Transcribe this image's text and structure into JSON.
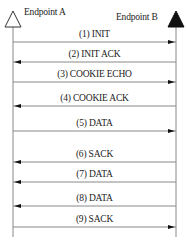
{
  "diagram": {
    "type": "sequence",
    "endpoints": [
      {
        "label": "Endpoint A",
        "marker": "hollow-triangle"
      },
      {
        "label": "Endpoint B",
        "marker": "filled-triangle"
      }
    ],
    "messages": [
      {
        "label": "(1) INIT",
        "direction": "A-to-B",
        "y": 42
      },
      {
        "label": "(2) INIT ACK",
        "direction": "B-to-A",
        "y": 62
      },
      {
        "label": "(3) COOKIE ECHO",
        "direction": "A-to-B",
        "y": 82
      },
      {
        "label": "(4) COOKIE ACK",
        "direction": "B-to-A",
        "y": 106
      },
      {
        "label": "(5) DATA",
        "direction": "A-to-B",
        "y": 131
      },
      {
        "label": "(6) SACK",
        "direction": "B-to-A",
        "y": 162
      },
      {
        "label": "(7) DATA",
        "direction": "B-to-A",
        "y": 182
      },
      {
        "label": "(8) DATA",
        "direction": "B-to-A",
        "y": 206
      },
      {
        "label": "(9) SACK",
        "direction": "A-to-B",
        "y": 227
      }
    ]
  },
  "colors": {
    "line": "#888888",
    "arrowhead": "#111111",
    "text": "#222222"
  }
}
